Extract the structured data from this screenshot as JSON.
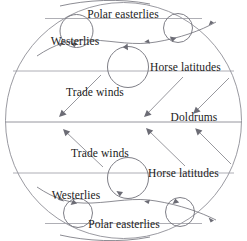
{
  "diagram": {
    "background_color": "#ffffff",
    "line_color": "#85858d",
    "text_color": "#1b1b1b",
    "width": 247,
    "height": 241,
    "labels": {
      "north_polar_easterlies": "Polar easterlies",
      "north_westerlies": "Westerlies",
      "north_horse_latitudes": "Horse latitudes",
      "north_trade_winds": "Trade winds",
      "doldrums": "Doldrums",
      "south_trade_winds": "Trade winds",
      "south_horse_latitudes": "Horse latitudes",
      "south_westerlies": "Westerlies",
      "south_polar_easterlies": "Polar easterlies"
    }
  }
}
